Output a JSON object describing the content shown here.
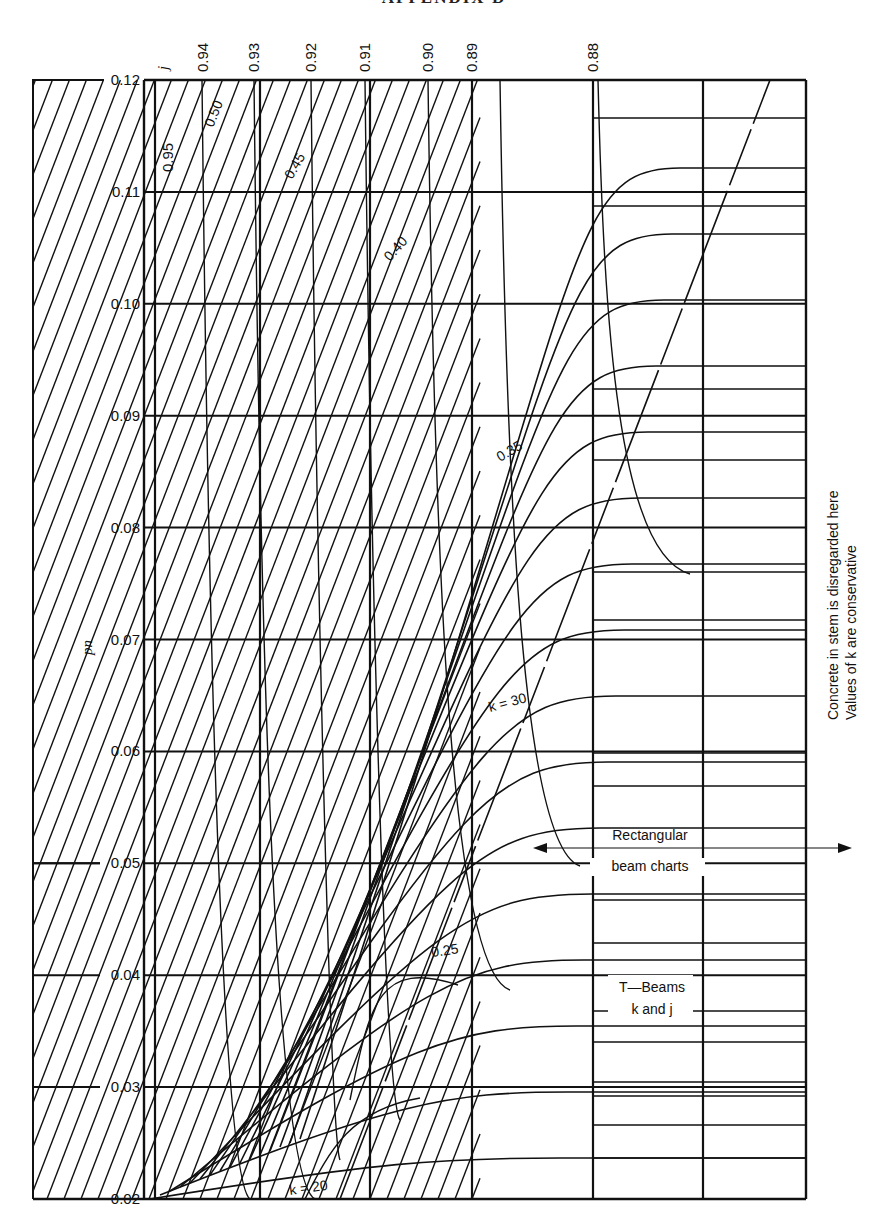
{
  "page": {
    "header": "APPENDIX D"
  },
  "chart_data": {
    "type": "line",
    "ylabel": "pn",
    "xlabel": "",
    "ylim": [
      0.02,
      0.12
    ],
    "y_ticks": [
      "0.12",
      "0.11",
      "0.10",
      "0.09",
      "0.08",
      "0.07",
      "0.06",
      "0.05",
      "0.04",
      "0.03",
      "0.02"
    ],
    "j_axis_label": "j",
    "j_ticks": [
      "0.94",
      "0.93",
      "0.92",
      "0.91",
      "0.90",
      "0.89",
      "0.88"
    ],
    "j_inner_label": "0.95",
    "k_curve_labels": [
      "0.50",
      "0.45",
      "0.40",
      "0.35",
      "0.25"
    ],
    "k_equation_labels": [
      "k = 30",
      "k = 20"
    ],
    "annotations": {
      "rect_line1": "Rectangular",
      "rect_line2": "beam charts",
      "tbeam_line1": "T—Beams",
      "tbeam_line2": "k and j",
      "side_note_line1": "Concrete in stem is disregarded here",
      "side_note_line2": "Values of k are conservative"
    },
    "grid": true,
    "legend_position": "none",
    "series": [
      {
        "name": "j = 0.95",
        "x_at_top": 155,
        "x_at_bottom": 155
      },
      {
        "name": "j = 0.94",
        "x_at_top": 203,
        "x_at_bottom": 185
      },
      {
        "name": "j = 0.93",
        "x_at_top": 254,
        "x_at_bottom": 260
      },
      {
        "name": "j = 0.92",
        "x_at_top": 311,
        "x_at_bottom": 295
      },
      {
        "name": "j = 0.91",
        "x_at_top": 365,
        "x_at_bottom": 370
      },
      {
        "name": "j = 0.90",
        "x_at_top": 428,
        "x_at_bottom": 405
      },
      {
        "name": "j = 0.89",
        "x_at_top": 472,
        "x_at_bottom": 472
      },
      {
        "name": "j = 0.88",
        "x_at_top": 593,
        "x_at_bottom": 593
      }
    ]
  }
}
